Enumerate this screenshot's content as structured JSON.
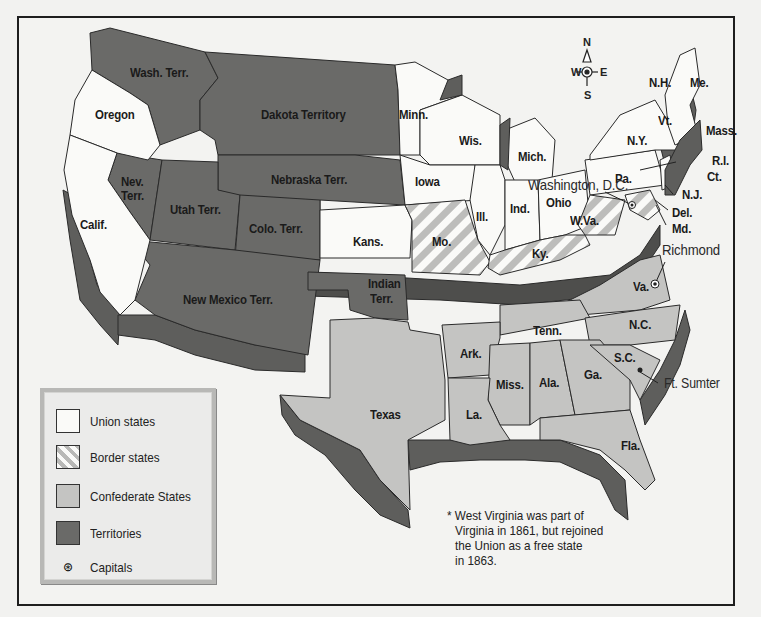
{
  "map": {
    "title": "",
    "legend": {
      "items": [
        {
          "key": "union",
          "label": "Union states",
          "color": "#fafaf8"
        },
        {
          "key": "border",
          "label": "Border states",
          "pattern": "diagonal-stripes"
        },
        {
          "key": "confederate",
          "label": "Confederate States",
          "color": "#c4c4c2"
        },
        {
          "key": "territories",
          "label": "Territories",
          "color": "#6a6a68"
        },
        {
          "key": "capitals",
          "label": "Capitals",
          "icon": "star-in-circle"
        }
      ]
    },
    "compass": {
      "n": "N",
      "e": "E",
      "s": "S",
      "w": "W"
    },
    "regions": {
      "union": [
        "Oregon",
        "Calif.",
        "Minn.",
        "Wis.",
        "Mich.",
        "Iowa",
        "Ill.",
        "Ind.",
        "Ohio",
        "Kans.",
        "Pa.",
        "N.Y.",
        "Vt.",
        "N.H.",
        "Me.",
        "Mass.",
        "R.I.",
        "Ct.",
        "N.J.",
        "W.Va."
      ],
      "border": [
        "Mo.",
        "Ky.",
        "Md.",
        "Del.",
        "W.Va."
      ],
      "confederate": [
        "Va.",
        "N.C.",
        "S.C.",
        "Ga.",
        "Fla.",
        "Ala.",
        "Miss.",
        "La.",
        "Tenn.",
        "Ark.",
        "Texas"
      ],
      "territories": [
        "Wash. Terr.",
        "Dakota Territory",
        "Nebraska Terr.",
        "Nev. Terr.",
        "Utah Terr.",
        "Colo. Terr.",
        "New Mexico Terr.",
        "Indian Terr."
      ]
    },
    "labels": {
      "oregon": "Oregon",
      "wash": "Wash. Terr.",
      "dakota": "Dakota Territory",
      "minn": "Minn.",
      "wis": "Wis.",
      "mich": "Mich.",
      "iowa": "Iowa",
      "nebraska": "Nebraska Terr.",
      "nev1": "Nev.",
      "nev2": "Terr.",
      "utah": "Utah Terr.",
      "colo": "Colo. Terr.",
      "calif": "Calif.",
      "kans": "Kans.",
      "mo": "Mo.",
      "ill": "Ill.",
      "ind": "Ind.",
      "ohio": "Ohio",
      "ky": "Ky.",
      "wva": "W.Va.",
      "pa": "Pa.",
      "ny": "N.Y.",
      "vt": "Vt.",
      "nh": "N.H.",
      "me": "Me.",
      "mass": "Mass.",
      "ri": "R.I.",
      "ct": "Ct.",
      "nj": "N.J.",
      "del": "Del.",
      "md": "Md.",
      "nm": "New Mexico Terr.",
      "indian1": "Indian",
      "indian2": "Terr.",
      "texas": "Texas",
      "ark": "Ark.",
      "tenn": "Tenn.",
      "nc": "N.C.",
      "sc": "S.C.",
      "ga": "Ga.",
      "ala": "Ala.",
      "miss": "Miss.",
      "la": "La.",
      "fla": "Fla.",
      "va": "Va."
    },
    "callouts": {
      "washington_dc": "Washington, D.C.",
      "richmond": "Richmond",
      "ft_sumter": "Ft. Sumter"
    },
    "footnote": [
      "* West Virginia was part of",
      "Virginia in 1861, but rejoined",
      "the Union as a free state",
      "in 1863."
    ]
  }
}
